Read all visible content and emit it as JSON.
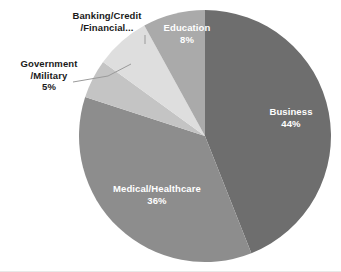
{
  "chart_data": {
    "type": "pie",
    "title": "",
    "subtitle": "",
    "xlabel": "",
    "ylabel": "",
    "legend_position": "labels-on-slices",
    "grid": false,
    "total_percent": 100,
    "start_angle_deg": 0,
    "direction": "clockwise",
    "categories": [
      "Business",
      "Medical/Healthcare",
      "Government/Military",
      "Banking/Credit/Financial...",
      "Education"
    ],
    "values": [
      44,
      36,
      5,
      7,
      8
    ],
    "slices": [
      {
        "name": "Business",
        "label_line_1": "Business",
        "label_line_2": "44%",
        "value": 44,
        "percent_text": "44%",
        "color": "#6e6e6e",
        "label_color": "#ffffff",
        "label_placement": "inside"
      },
      {
        "name": "Medical/Healthcare",
        "label_line_1": "Medical/Healthcare",
        "label_line_2": "36%",
        "value": 36,
        "percent_text": "36%",
        "color": "#8d8d8d",
        "label_color": "#ffffff",
        "label_placement": "inside"
      },
      {
        "name": "Government/Military",
        "label_line_1": "Government",
        "label_line_2": "/Military",
        "label_line_3": "5%",
        "value": 5,
        "percent_text": "5%",
        "color": "#c4c4c4",
        "label_color": "#1a1a1a",
        "label_placement": "outside-with-leader"
      },
      {
        "name": "Banking/Credit/Financial...",
        "label_line_1": "Banking/Credit",
        "label_line_2": "/Financial...",
        "value": 7,
        "percent_text": "",
        "color": "#dedede",
        "label_color": "#1a1a1a",
        "label_placement": "outside"
      },
      {
        "name": "Education",
        "label_line_1": "Education",
        "label_line_2": "8%",
        "value": 8,
        "percent_text": "8%",
        "color": "#aaaaaa",
        "label_color": "#ffffff",
        "label_placement": "inside"
      }
    ],
    "geometry": {
      "center_x": 205,
      "center_y": 136,
      "radius": 126
    }
  },
  "colors": {
    "background": "#ffffff",
    "outer_label_text": "#1a1a1a",
    "inner_label_text": "#ffffff",
    "leader_line": "#9a9a9a",
    "bottom_rule": "#e8e8e8"
  }
}
